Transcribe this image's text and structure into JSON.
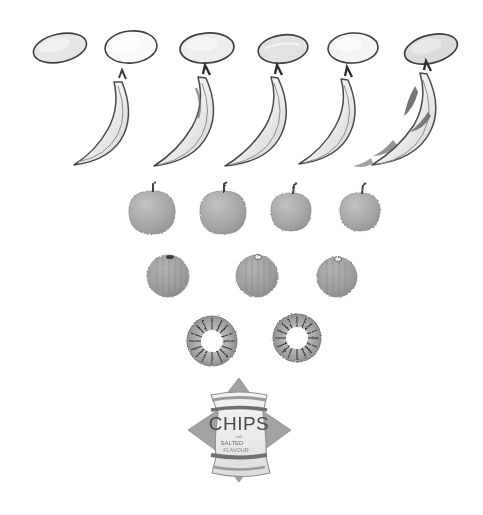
{
  "page": {
    "background_color": "#ffffff",
    "width": 483,
    "height": 515,
    "medium": "pencil-graphite-sketch",
    "arrangement": "inverted-pyramid",
    "row_counts": [
      6,
      5,
      4,
      3,
      2,
      1
    ]
  },
  "palette": {
    "outline": "#3a3a3a",
    "outline_soft": "#6b6b6b",
    "potato_fill": "#efefef",
    "banana_fill": "#f2f2f2",
    "banana_shade": "#c9c9c9",
    "banana_dark": "#5a5a5a",
    "apple_fill": "#a9a9a9",
    "orange_fill": "#9e9e9e",
    "kiwi_fill": "#9a9a9a",
    "kiwi_core": "#ffffff",
    "bag_fill": "#e9e9e9",
    "bag_dark": "#a0a0a0",
    "bag_stripe": "#8a8a8a",
    "text": "#4a4a4a"
  },
  "rows": [
    {
      "id": "row-potatoes",
      "label": "Potatoes",
      "item_name": "potato",
      "count": 6,
      "items": [
        {
          "label": "Potato 1",
          "cx": 60,
          "cy": 48,
          "rx": 27,
          "ry": 14,
          "rot": -12,
          "fill": "#e6e6e6"
        },
        {
          "label": "Potato 2",
          "cx": 131,
          "cy": 47,
          "rx": 26,
          "ry": 16,
          "rot": -5,
          "fill": "#fafafa"
        },
        {
          "label": "Potato 3",
          "cx": 207,
          "cy": 48,
          "rx": 27,
          "ry": 15,
          "rot": -4,
          "fill": "#ededed"
        },
        {
          "label": "Potato 4",
          "cx": 283,
          "cy": 49,
          "rx": 25,
          "ry": 14,
          "rot": -8,
          "fill": "#e2e2e2"
        },
        {
          "label": "Potato 5",
          "cx": 353,
          "cy": 48,
          "rx": 25,
          "ry": 15,
          "rot": -3,
          "fill": "#f4f4f4"
        },
        {
          "label": "Potato 6",
          "cx": 431,
          "cy": 49,
          "rx": 27,
          "ry": 14,
          "rot": -14,
          "fill": "#dcdcdc"
        }
      ]
    },
    {
      "id": "row-bananas",
      "label": "Bananas",
      "item_name": "banana",
      "count": 5,
      "items": [
        {
          "label": "Banana 1",
          "x": 62,
          "y": 78,
          "w": 78,
          "h": 88,
          "spots": false
        },
        {
          "label": "Banana 2",
          "x": 146,
          "y": 72,
          "w": 78,
          "h": 94,
          "spots": false
        },
        {
          "label": "Banana 3",
          "x": 218,
          "y": 72,
          "w": 78,
          "h": 94,
          "spots": false
        },
        {
          "label": "Banana 4",
          "x": 290,
          "y": 74,
          "w": 72,
          "h": 90,
          "spots": false
        },
        {
          "label": "Banana 5",
          "x": 366,
          "y": 70,
          "w": 78,
          "h": 96,
          "spots": true
        }
      ]
    },
    {
      "id": "row-apples",
      "label": "Apples",
      "item_name": "apple",
      "count": 4,
      "items": [
        {
          "label": "Apple 1",
          "cx": 152,
          "cy": 212,
          "r": 22
        },
        {
          "label": "Apple 2",
          "cx": 223,
          "cy": 212,
          "r": 22
        },
        {
          "label": "Apple 3",
          "cx": 291,
          "cy": 212,
          "r": 19
        },
        {
          "label": "Apple 4",
          "cx": 360,
          "cy": 212,
          "r": 19
        }
      ]
    },
    {
      "id": "row-oranges",
      "label": "Oranges",
      "item_name": "orange",
      "count": 3,
      "items": [
        {
          "label": "Orange 1",
          "cx": 168,
          "cy": 276,
          "r": 21
        },
        {
          "label": "Orange 2",
          "cx": 257,
          "cy": 276,
          "r": 21
        },
        {
          "label": "Orange 3",
          "cx": 337,
          "cy": 277,
          "r": 20
        }
      ]
    },
    {
      "id": "row-kiwis",
      "label": "Kiwi slices",
      "item_name": "kiwi-slice",
      "count": 2,
      "items": [
        {
          "label": "Kiwi slice 1",
          "cx": 212,
          "cy": 341,
          "r": 25,
          "core": 11
        },
        {
          "label": "Kiwi slice 2",
          "cx": 297,
          "cy": 338,
          "r": 24,
          "core": 11
        }
      ]
    },
    {
      "id": "row-chips",
      "label": "Chips bag",
      "item_name": "chips-bag",
      "count": 1,
      "items": [
        {
          "label": "Chips bag",
          "cx": 239,
          "cy": 430,
          "w": 104,
          "h": 104
        }
      ]
    }
  ],
  "chips_bag": {
    "brand_text": "CHIPS",
    "sub_line_1": "with",
    "sub_line_2": "SALTED",
    "sub_line_3": "FLAVOUR"
  }
}
